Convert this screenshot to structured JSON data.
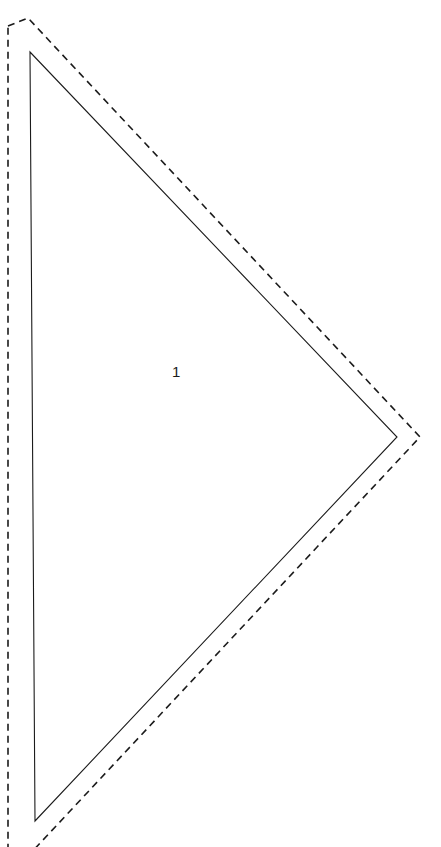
{
  "page": {
    "width": 441,
    "height": 847,
    "background_color": "#ffffff"
  },
  "header": {
    "title": "e One Quilt",
    "note": "clipped at top edge of page"
  },
  "pattern": {
    "piece_label": "1",
    "cut_line_style": "dashed",
    "sew_line_style": "solid",
    "line_color": "#1b1b1b",
    "fill_color": "#ffffff",
    "sew_line": {
      "points": "30,52 397,437 35,821",
      "apex_top": "30,52",
      "apex_right": "397,437",
      "apex_bottom": "35,821"
    },
    "cut_line": {
      "points": "8,26 28,18 420,437 28,856 8,848",
      "seam_allowance_px": 28,
      "dash_length": 7,
      "dash_gap": 5
    }
  },
  "chart_data": {
    "type": "diagram",
    "title": "e One Quilt",
    "shapes": [
      {
        "name": "sew-line-triangle",
        "type": "triangle",
        "style": "solid",
        "vertices": [
          [
            30,
            52
          ],
          [
            397,
            437
          ],
          [
            35,
            821
          ]
        ],
        "label": "1"
      },
      {
        "name": "cut-line-outline",
        "type": "polygon",
        "style": "dashed",
        "vertices": [
          [
            8,
            26
          ],
          [
            28,
            18
          ],
          [
            420,
            437
          ],
          [
            28,
            856
          ],
          [
            8,
            848
          ]
        ]
      }
    ]
  }
}
